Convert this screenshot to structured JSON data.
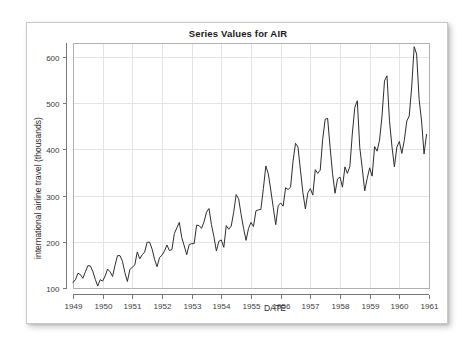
{
  "chart_data": {
    "type": "line",
    "title": "Series Values for AIR",
    "xlabel": "DATE",
    "ylabel": "international airline travel (thousands)",
    "xlim": [
      1949.0,
      1961.0
    ],
    "ylim": [
      100,
      630
    ],
    "grid": true,
    "legend": "none",
    "series_name": "AIR",
    "line_color": "#2e2e2e",
    "grid_color": "#e3e3e3",
    "frame_color": "#b0b0b0",
    "x_tick_labels": [
      "1949",
      "1950",
      "1951",
      "1952",
      "1953",
      "1954",
      "1955",
      "1956",
      "1957",
      "1958",
      "1959",
      "1960",
      "1961"
    ],
    "x_tick_values": [
      1949,
      1950,
      1951,
      1952,
      1953,
      1954,
      1955,
      1956,
      1957,
      1958,
      1959,
      1960,
      1961
    ],
    "y_tick_labels": [
      "100",
      "200",
      "300",
      "400",
      "500",
      "600"
    ],
    "y_tick_values": [
      100,
      200,
      300,
      400,
      500,
      600
    ],
    "x_start": 1949.0,
    "x_step": 0.0833333,
    "n_points": 144,
    "values": [
      112,
      118,
      132,
      129,
      121,
      135,
      148,
      148,
      136,
      119,
      104,
      118,
      115,
      126,
      141,
      135,
      125,
      149,
      170,
      170,
      158,
      133,
      114,
      140,
      145,
      150,
      178,
      163,
      172,
      178,
      199,
      199,
      184,
      162,
      146,
      166,
      171,
      180,
      193,
      181,
      183,
      218,
      230,
      242,
      209,
      191,
      172,
      194,
      196,
      196,
      236,
      235,
      229,
      243,
      264,
      272,
      237,
      211,
      180,
      201,
      204,
      188,
      235,
      227,
      234,
      264,
      302,
      293,
      259,
      229,
      203,
      229,
      242,
      233,
      267,
      269,
      270,
      315,
      364,
      347,
      312,
      274,
      237,
      278,
      284,
      277,
      317,
      313,
      318,
      374,
      413,
      405,
      355,
      306,
      271,
      306,
      315,
      301,
      356,
      348,
      355,
      422,
      465,
      467,
      404,
      347,
      305,
      336,
      340,
      318,
      362,
      348,
      363,
      435,
      491,
      505,
      404,
      359,
      310,
      337,
      360,
      342,
      406,
      396,
      420,
      472,
      548,
      559,
      463,
      407,
      362,
      405,
      417,
      391,
      419,
      461,
      472,
      535,
      622,
      606,
      508,
      461,
      390,
      432
    ]
  }
}
